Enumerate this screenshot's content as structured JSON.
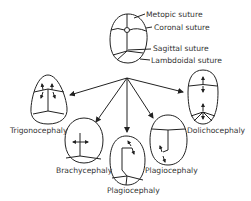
{
  "normal_skull": {
    "sutures": [
      {
        "label": "Metopic suture"
      },
      {
        "label": "Coronal suture"
      },
      {
        "label": "Sagittal suture"
      },
      {
        "label": "Lambdoidal suture"
      }
    ]
  },
  "deformities": [
    {
      "label": "Trigonocephaly"
    },
    {
      "label": "Brachycephaly"
    },
    {
      "label": "Plagiocephaly"
    },
    {
      "label": "Plagiocephaly"
    },
    {
      "label": "Dolichocephaly"
    }
  ],
  "colors": {
    "line": "#222222",
    "text": "#333333",
    "background": "#ffffff"
  }
}
